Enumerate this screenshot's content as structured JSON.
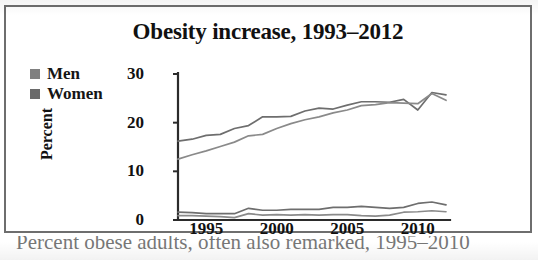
{
  "figure": {
    "title": "Obesity increase, 1993–2012",
    "caption_partial": "Percent obese adults, often also remarked, 1995–2010",
    "border_color": "#6e6e6e",
    "background": "#ffffff"
  },
  "legend": {
    "position": "top-left",
    "items": [
      {
        "label": "Men",
        "swatch_color": "#808080"
      },
      {
        "label": "Women",
        "swatch_color": "#6a6a6a"
      }
    ]
  },
  "chart_data": {
    "type": "line",
    "title": "Obesity increase, 1993–2012",
    "xlabel": "",
    "ylabel": "Percent",
    "xlim": [
      1993,
      2012
    ],
    "ylim": [
      0,
      30
    ],
    "yticks": [
      0,
      10,
      20,
      30
    ],
    "ytick_labels": [
      "0",
      "10",
      "20",
      "30"
    ],
    "xticks": [
      1995,
      2000,
      2005,
      2010
    ],
    "xtick_labels": [
      "1995",
      "2000",
      "2005",
      "2010"
    ],
    "grid": false,
    "legend_position": "outside-top-left",
    "x": [
      1993,
      1994,
      1995,
      1996,
      1997,
      1998,
      1999,
      2000,
      2001,
      2002,
      2003,
      2004,
      2005,
      2006,
      2007,
      2008,
      2009,
      2010,
      2011,
      2012
    ],
    "series": [
      {
        "name": "Men",
        "color": "#6e6e6e",
        "values": [
          16.2,
          16.6,
          17.4,
          17.6,
          18.8,
          19.4,
          21.2,
          21.2,
          21.3,
          22.4,
          23.0,
          22.8,
          23.6,
          24.3,
          24.3,
          24.2,
          24.8,
          22.6,
          26.2,
          25.7
        ]
      },
      {
        "name": "Women",
        "color": "#8a8a8a",
        "values": [
          12.5,
          13.4,
          14.2,
          15.1,
          16.0,
          17.3,
          17.6,
          18.8,
          19.8,
          20.6,
          21.2,
          22.0,
          22.6,
          23.5,
          23.7,
          24.1,
          24.0,
          23.9,
          26.0,
          24.6
        ]
      },
      {
        "name": "Men low band",
        "color": "#6e6e6e",
        "values": [
          1.6,
          1.5,
          1.3,
          1.3,
          1.3,
          2.4,
          2.0,
          2.0,
          2.2,
          2.2,
          2.2,
          2.6,
          2.6,
          2.8,
          2.6,
          2.4,
          2.6,
          3.4,
          3.7,
          3.1
        ]
      },
      {
        "name": "Women low band",
        "color": "#8a8a8a",
        "values": [
          0.9,
          0.9,
          0.8,
          0.7,
          0.5,
          1.3,
          1.0,
          1.1,
          1.0,
          1.1,
          1.0,
          1.1,
          1.1,
          0.9,
          0.8,
          1.0,
          1.6,
          1.7,
          1.9,
          1.7
        ]
      }
    ]
  },
  "axes_geometry": {
    "plot_left_px": 172,
    "plot_right_px": 440,
    "y_zero_px": 213,
    "y_top_px": 67
  }
}
